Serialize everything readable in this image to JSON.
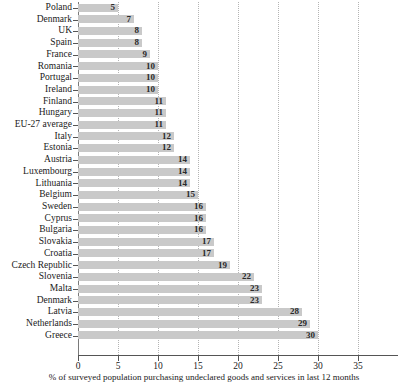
{
  "chart_data": {
    "type": "bar",
    "orientation": "horizontal",
    "title": "",
    "subtitle": "",
    "xlabel": "% of surveyed population purchasing undeclared goods and services in last 12 months",
    "ylabel": "",
    "xlim": [
      0,
      35
    ],
    "xticks": [
      0,
      5,
      10,
      15,
      20,
      25,
      30,
      35
    ],
    "xticklabels": [
      "0",
      "5",
      "10",
      "15",
      "20",
      "25",
      "30",
      "35"
    ],
    "grid": "vertical-dotted",
    "legend": "none",
    "bar_color": "#c9c9c9",
    "value_labels_inside": true,
    "categories": [
      "Poland",
      "Denmark",
      "UK",
      "Spain",
      "France",
      "Romania",
      "Portugal",
      "Ireland",
      "Finland",
      "Hungary",
      "EU-27 average",
      "Italy",
      "Estonia",
      "Austria",
      "Luxembourg",
      "Lithuania",
      "Belgium",
      "Sweden",
      "Cyprus",
      "Bulgaria",
      "Slovakia",
      "Croatia",
      "Czech Republic",
      "Slovenia",
      "Malta",
      "Denmark",
      "Latvia",
      "Netherlands",
      "Greece"
    ],
    "values": [
      5,
      7,
      8,
      8,
      9,
      10,
      10,
      10,
      11,
      11,
      11,
      12,
      12,
      14,
      14,
      14,
      15,
      16,
      16,
      16,
      17,
      17,
      19,
      22,
      23,
      23,
      28,
      29,
      30
    ],
    "value_labels": [
      "5",
      "7",
      "8",
      "8",
      "9",
      "10",
      "10",
      "10",
      "11",
      "11",
      "11",
      "12",
      "12",
      "14",
      "14",
      "14",
      "15",
      "16",
      "16",
      "16",
      "17",
      "17",
      "19",
      "22",
      "23",
      "23",
      "28",
      "29",
      "30"
    ]
  }
}
